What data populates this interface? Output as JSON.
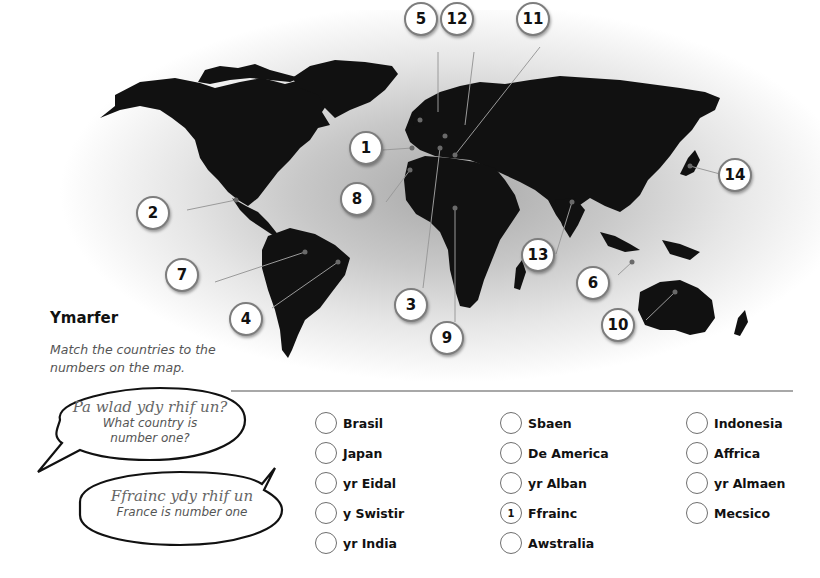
{
  "exercise": {
    "title": "Ymarfer",
    "instruction": "Match the countries to the numbers on the map."
  },
  "bubbles": {
    "question": {
      "welsh": "Pa wlad ydy rhif un?",
      "english": "What country is number one?"
    },
    "answer": {
      "welsh": "Ffrainc ydy rhif un",
      "english": "France is number one"
    }
  },
  "map_markers": [
    {
      "number": "1",
      "x": 349,
      "y": 148
    },
    {
      "number": "2",
      "x": 153,
      "y": 212
    },
    {
      "number": "3",
      "x": 410,
      "y": 305
    },
    {
      "number": "4",
      "x": 245,
      "y": 318
    },
    {
      "number": "5",
      "x": 421,
      "y": 18
    },
    {
      "number": "6",
      "x": 592,
      "y": 282
    },
    {
      "number": "7",
      "x": 181,
      "y": 272
    },
    {
      "number": "8",
      "x": 357,
      "y": 198
    },
    {
      "number": "9",
      "x": 447,
      "y": 338
    },
    {
      "number": "10",
      "x": 616,
      "y": 325
    },
    {
      "number": "11",
      "x": 533,
      "y": 18
    },
    {
      "number": "12",
      "x": 457,
      "y": 18
    },
    {
      "number": "13",
      "x": 538,
      "y": 254
    },
    {
      "number": "14",
      "x": 733,
      "y": 174
    }
  ],
  "options": {
    "columns": [
      [
        {
          "label": "Brasil",
          "answer": ""
        },
        {
          "label": "Japan",
          "answer": ""
        },
        {
          "label": "yr Eidal",
          "answer": ""
        },
        {
          "label": "y Swistir",
          "answer": ""
        },
        {
          "label": "yr India",
          "answer": ""
        }
      ],
      [
        {
          "label": "Sbaen",
          "answer": ""
        },
        {
          "label": "De America",
          "answer": ""
        },
        {
          "label": "yr Alban",
          "answer": ""
        },
        {
          "label": "Ffrainc",
          "answer": "1"
        },
        {
          "label": "Awstralia",
          "answer": ""
        }
      ],
      [
        {
          "label": "Indonesia",
          "answer": ""
        },
        {
          "label": "Affrica",
          "answer": ""
        },
        {
          "label": "yr Almaen",
          "answer": ""
        },
        {
          "label": "Mecsico",
          "answer": ""
        }
      ]
    ]
  }
}
